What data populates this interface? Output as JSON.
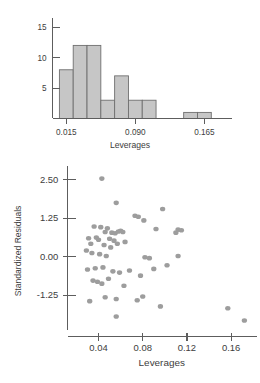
{
  "figure": {
    "kind": "statistical-diagnostic-figure",
    "panel_count": 2,
    "point_color": "#9d9d9d",
    "bar_fill_color": "#c6c6c6",
    "bar_edge_color": "#6f6f6f",
    "axis_color": "#5d5d5d"
  },
  "chart_data": [
    {
      "type": "bar",
      "subtype": "histogram",
      "title": "",
      "xlabel": "Leverages",
      "ylabel": "",
      "xlim": [
        0.0,
        0.195
      ],
      "ylim": [
        0,
        16.5
      ],
      "grid": false,
      "legend": null,
      "xticks": [
        0.015,
        0.09,
        0.165
      ],
      "xtick_labels": [
        "0.015",
        "0.090",
        "0.165"
      ],
      "yticks": [
        5,
        10,
        15
      ],
      "ytick_labels": [
        "5",
        "10",
        "15"
      ],
      "bin_width": 0.015,
      "bin_edges": [
        0.0075,
        0.0225,
        0.0375,
        0.0525,
        0.0675,
        0.0825,
        0.0975,
        0.1125,
        0.1275,
        0.1425,
        0.1575,
        0.1725
      ],
      "categories": [
        "0.0075-0.0225",
        "0.0225-0.0375",
        "0.0375-0.0525",
        "0.0525-0.0675",
        "0.0675-0.0825",
        "0.0825-0.0975",
        "0.0975-0.1125",
        "0.1125-0.1275",
        "0.1275-0.1425",
        "0.1425-0.1575",
        "0.1575-0.1725"
      ],
      "values": [
        8,
        12,
        12,
        3,
        7,
        3,
        3,
        0,
        0,
        1,
        1
      ]
    },
    {
      "type": "scatter",
      "title": "",
      "xlabel": "Leverages",
      "ylabel": "Standardized Residuals",
      "xlim": [
        0.012,
        0.183
      ],
      "ylim": [
        -2.6,
        2.95
      ],
      "grid": false,
      "legend": null,
      "xticks": [
        0.04,
        0.08,
        0.12,
        0.16
      ],
      "xtick_labels": [
        "0.04",
        "0.08",
        "0.12",
        "0.16"
      ],
      "yticks": [
        2.5,
        1.25,
        0.0,
        -1.25
      ],
      "ytick_labels": [
        "2.50",
        "1.25",
        "0.00",
        "-1.25"
      ],
      "x": [
        0.043,
        0.056,
        0.073,
        0.098,
        0.076,
        0.081,
        0.092,
        0.112,
        0.036,
        0.042,
        0.048,
        0.046,
        0.052,
        0.055,
        0.058,
        0.06,
        0.062,
        0.11,
        0.115,
        0.031,
        0.038,
        0.04,
        0.05,
        0.054,
        0.064,
        0.029,
        0.033,
        0.045,
        0.051,
        0.057,
        0.034,
        0.041,
        0.047,
        0.082,
        0.086,
        0.102,
        0.112,
        0.03,
        0.037,
        0.044,
        0.053,
        0.059,
        0.068,
        0.078,
        0.09,
        0.035,
        0.039,
        0.043,
        0.049,
        0.063,
        0.032,
        0.046,
        0.056,
        0.075,
        0.08,
        0.056,
        0.096,
        0.157,
        0.172
      ],
      "y": [
        2.54,
        1.75,
        1.33,
        1.55,
        1.3,
        1.18,
        0.9,
        0.88,
        0.98,
        0.96,
        0.92,
        0.8,
        0.78,
        0.76,
        0.82,
        0.84,
        0.8,
        0.78,
        0.86,
        0.6,
        0.62,
        0.55,
        0.58,
        0.52,
        0.48,
        0.2,
        0.42,
        0.38,
        0.3,
        0.42,
        0.12,
        0.08,
        0.02,
        -0.02,
        -0.05,
        -0.28,
        0.02,
        -0.42,
        -0.38,
        -0.35,
        -0.48,
        -0.52,
        -0.45,
        -0.62,
        -0.4,
        -0.78,
        -0.82,
        -0.88,
        -0.72,
        -0.95,
        -1.45,
        -1.32,
        -1.38,
        -1.42,
        -1.3,
        -1.95,
        -1.62,
        -1.68,
        -2.08
      ]
    }
  ],
  "histogram": {
    "axis_title": "Leverages",
    "x_tick_labels": [
      "0.015",
      "0.090",
      "0.165"
    ],
    "y_tick_labels": [
      "15",
      "10",
      "5"
    ]
  },
  "scatter": {
    "x_axis_title": "Leverages",
    "y_axis_title": "Standardized Residuals",
    "x_tick_labels": [
      "0.04",
      "0.08",
      "0.12",
      "0.16"
    ],
    "y_tick_labels": [
      "2.50",
      "1.25",
      "0.00",
      "-1.25"
    ]
  }
}
